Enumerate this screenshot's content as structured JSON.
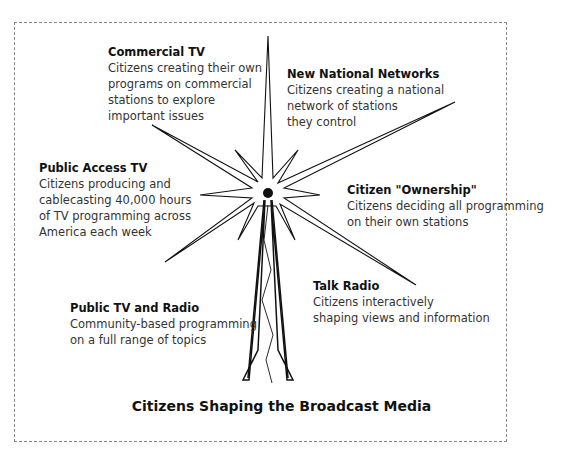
{
  "diagram": {
    "title": "Citizens Shaping the Broadcast Media",
    "center_icon": "broadcast-tower-icon",
    "colors": {
      "line": "#111111",
      "text": "#333333",
      "frame": "#888888"
    },
    "nodes": [
      {
        "id": "commercial-tv",
        "heading": "Commercial TV",
        "lines": [
          "Citizens creating their own",
          "programs on commercial",
          "stations to explore",
          "important issues"
        ]
      },
      {
        "id": "new-national-networks",
        "heading": "New National Networks",
        "lines": [
          "Citizens creating a national",
          "network of stations",
          "they control"
        ]
      },
      {
        "id": "public-access-tv",
        "heading": "Public Access TV",
        "lines": [
          "Citizens producing and",
          "cablecasting 40,000 hours",
          "of TV programming across",
          "America  each week"
        ]
      },
      {
        "id": "citizen-ownership",
        "heading": "Citizen \"Ownership\"",
        "lines": [
          "Citizens deciding all programming",
          "on their own stations"
        ]
      },
      {
        "id": "talk-radio",
        "heading": "Talk Radio",
        "lines": [
          "Citizens interactively",
          "shaping views and information"
        ]
      },
      {
        "id": "public-tv-radio",
        "heading": "Public TV and Radio",
        "lines": [
          "Community-based programming",
          "on a full range of topics"
        ]
      }
    ]
  }
}
